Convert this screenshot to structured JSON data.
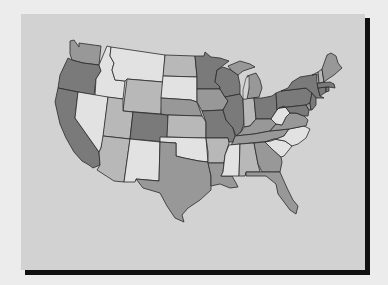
{
  "legend_classes": {
    "c1": {
      "label": "lightest",
      "color": "#e2e2e2"
    },
    "c2": {
      "label": "light",
      "color": "#b8b8b8"
    },
    "c3": {
      "label": "medium",
      "color": "#989898"
    },
    "c4": {
      "label": "darkest",
      "color": "#7a7a7a"
    }
  },
  "colors": {
    "page_background": "#ececec",
    "panel_background": "#d2d2d2",
    "frame_shadow": "#111111",
    "state_border": "#2a2a2a"
  },
  "states": [
    {
      "id": "WA",
      "class": "c3"
    },
    {
      "id": "OR",
      "class": "c4"
    },
    {
      "id": "CA",
      "class": "c4"
    },
    {
      "id": "ID",
      "class": "c1"
    },
    {
      "id": "NV",
      "class": "c1"
    },
    {
      "id": "MT",
      "class": "c1"
    },
    {
      "id": "WY",
      "class": "c2"
    },
    {
      "id": "UT",
      "class": "c2"
    },
    {
      "id": "AZ",
      "class": "c2"
    },
    {
      "id": "CO",
      "class": "c4"
    },
    {
      "id": "NM",
      "class": "c1"
    },
    {
      "id": "ND",
      "class": "c2"
    },
    {
      "id": "SD",
      "class": "c1"
    },
    {
      "id": "NE",
      "class": "c3"
    },
    {
      "id": "KS",
      "class": "c2"
    },
    {
      "id": "OK",
      "class": "c1"
    },
    {
      "id": "TX",
      "class": "c3"
    },
    {
      "id": "MN",
      "class": "c4"
    },
    {
      "id": "IA",
      "class": "c3"
    },
    {
      "id": "MO",
      "class": "c4"
    },
    {
      "id": "AR",
      "class": "c2"
    },
    {
      "id": "LA",
      "class": "c3"
    },
    {
      "id": "WI",
      "class": "c4"
    },
    {
      "id": "IL",
      "class": "c4"
    },
    {
      "id": "MI",
      "class": "c3"
    },
    {
      "id": "IN",
      "class": "c2"
    },
    {
      "id": "OH",
      "class": "c4"
    },
    {
      "id": "KY",
      "class": "c3"
    },
    {
      "id": "TN",
      "class": "c3"
    },
    {
      "id": "MS",
      "class": "c1"
    },
    {
      "id": "AL",
      "class": "c2"
    },
    {
      "id": "GA",
      "class": "c3"
    },
    {
      "id": "FL",
      "class": "c3"
    },
    {
      "id": "SC",
      "class": "c1"
    },
    {
      "id": "NC",
      "class": "c1"
    },
    {
      "id": "VA",
      "class": "c3"
    },
    {
      "id": "WV",
      "class": "c1"
    },
    {
      "id": "PA",
      "class": "c4"
    },
    {
      "id": "NY",
      "class": "c4"
    },
    {
      "id": "MD",
      "class": "c4"
    },
    {
      "id": "DE",
      "class": "c3"
    },
    {
      "id": "NJ",
      "class": "c4"
    },
    {
      "id": "CT",
      "class": "c4"
    },
    {
      "id": "RI",
      "class": "c4"
    },
    {
      "id": "MA",
      "class": "c4"
    },
    {
      "id": "VT",
      "class": "c1"
    },
    {
      "id": "NH",
      "class": "c2"
    },
    {
      "id": "ME",
      "class": "c3"
    }
  ]
}
